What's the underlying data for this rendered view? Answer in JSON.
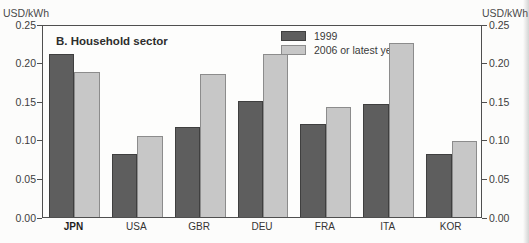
{
  "header": {
    "axis_title_left": "USD/kWh",
    "axis_title_right": "USD/kWh"
  },
  "chart_data": {
    "type": "bar",
    "title": "B. Household sector",
    "categories": [
      "JPN",
      "USA",
      "GBR",
      "DEU",
      "FRA",
      "ITA",
      "KOR"
    ],
    "bold_category": "JPN",
    "series": [
      {
        "name": "1999",
        "footnote": "",
        "color": "#5e5e5e",
        "border_color": "#3f3f3f",
        "values": [
          0.211,
          0.082,
          0.117,
          0.15,
          0.121,
          0.147,
          0.082
        ]
      },
      {
        "name": "2006 or latest year",
        "footnote": "2",
        "color": "#c7c7c7",
        "border_color": "#8c8c8c",
        "values": [
          0.188,
          0.105,
          0.185,
          0.211,
          0.143,
          0.225,
          0.098
        ]
      }
    ],
    "xlabel": "",
    "ylabel": "USD/kWh",
    "ylim": [
      0,
      0.25
    ],
    "ytick_labels": [
      "0.00",
      "0.05",
      "0.10",
      "0.15",
      "0.20",
      "0.25"
    ],
    "grid": false,
    "legend_position": "top-center-inside"
  }
}
